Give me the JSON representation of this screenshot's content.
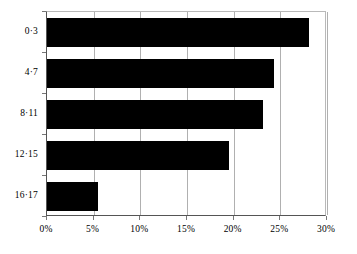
{
  "chart_data": {
    "type": "bar",
    "orientation": "horizontal",
    "title": "",
    "subtitle": "",
    "xlabel": "",
    "ylabel": "",
    "categories": [
      "0·3",
      "4·7",
      "8·11",
      "12·15",
      "16·17"
    ],
    "values": [
      28.1,
      24.3,
      23.1,
      19.5,
      5.5
    ],
    "series": [
      {
        "name": "",
        "values": [
          28.1,
          24.3,
          23.1,
          19.5,
          5.5
        ]
      }
    ],
    "xlim": [
      0,
      30
    ],
    "ylim": null,
    "x_ticks": [
      0,
      5,
      10,
      15,
      20,
      25,
      30
    ],
    "x_tick_labels": [
      "0%",
      "5%",
      "10%",
      "15%",
      "20%",
      "25%",
      "30%"
    ],
    "grid": "vertical",
    "legend": null,
    "annotations": [],
    "bar_color": "#000000",
    "gridline_color": "#b0b0b0",
    "axis_color": "#555555",
    "background_color": "#ffffff"
  }
}
